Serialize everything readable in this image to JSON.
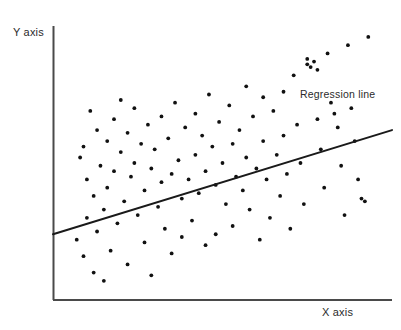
{
  "chart_data": {
    "type": "scatter",
    "title": "",
    "subtitle": "",
    "xlabel": "X axis",
    "ylabel": "Y axis",
    "xlim": [
      0,
      100
    ],
    "ylim": [
      0,
      100
    ],
    "grid": false,
    "legend_position": "none",
    "annotations": [
      {
        "name": "regression-line-label",
        "text": "Regression line",
        "x": 82,
        "y": 80
      }
    ],
    "series": [
      {
        "name": "observations",
        "marker": "circle",
        "marker_color": "#111111",
        "marker_size_px": 3,
        "points": [
          [
            7,
            22
          ],
          [
            8,
            52
          ],
          [
            9,
            56
          ],
          [
            9,
            16
          ],
          [
            10,
            44
          ],
          [
            10,
            30
          ],
          [
            11,
            69
          ],
          [
            12,
            10
          ],
          [
            12,
            38
          ],
          [
            13,
            62
          ],
          [
            13,
            25
          ],
          [
            14,
            49
          ],
          [
            15,
            33
          ],
          [
            15,
            7
          ],
          [
            16,
            58
          ],
          [
            16,
            41
          ],
          [
            17,
            18
          ],
          [
            18,
            66
          ],
          [
            18,
            47
          ],
          [
            19,
            28
          ],
          [
            20,
            73
          ],
          [
            20,
            54
          ],
          [
            21,
            36
          ],
          [
            22,
            61
          ],
          [
            22,
            13
          ],
          [
            23,
            45
          ],
          [
            24,
            70
          ],
          [
            24,
            50
          ],
          [
            25,
            31
          ],
          [
            26,
            57
          ],
          [
            27,
            40
          ],
          [
            27,
            21
          ],
          [
            28,
            64
          ],
          [
            29,
            48
          ],
          [
            29,
            9
          ],
          [
            30,
            55
          ],
          [
            31,
            34
          ],
          [
            32,
            67
          ],
          [
            32,
            43
          ],
          [
            33,
            26
          ],
          [
            34,
            59
          ],
          [
            35,
            46
          ],
          [
            35,
            17
          ],
          [
            36,
            72
          ],
          [
            37,
            51
          ],
          [
            38,
            37
          ],
          [
            38,
            23
          ],
          [
            39,
            63
          ],
          [
            40,
            44
          ],
          [
            41,
            29
          ],
          [
            42,
            68
          ],
          [
            42,
            53
          ],
          [
            43,
            39
          ],
          [
            44,
            60
          ],
          [
            45,
            20
          ],
          [
            45,
            47
          ],
          [
            46,
            75
          ],
          [
            47,
            56
          ],
          [
            48,
            42
          ],
          [
            48,
            24
          ],
          [
            49,
            65
          ],
          [
            50,
            50
          ],
          [
            51,
            35
          ],
          [
            52,
            71
          ],
          [
            53,
            57
          ],
          [
            53,
            27
          ],
          [
            54,
            45
          ],
          [
            55,
            62
          ],
          [
            56,
            40
          ],
          [
            57,
            78
          ],
          [
            57,
            52
          ],
          [
            58,
            33
          ],
          [
            59,
            67
          ],
          [
            60,
            48
          ],
          [
            61,
            22
          ],
          [
            62,
            74
          ],
          [
            62,
            58
          ],
          [
            63,
            44
          ],
          [
            64,
            30
          ],
          [
            65,
            69
          ],
          [
            66,
            53
          ],
          [
            67,
            38
          ],
          [
            68,
            76
          ],
          [
            68,
            60
          ],
          [
            69,
            46
          ],
          [
            70,
            26
          ],
          [
            71,
            82
          ],
          [
            72,
            64
          ],
          [
            73,
            50
          ],
          [
            74,
            35
          ],
          [
            75,
            88
          ],
          [
            75,
            86
          ],
          [
            76,
            85
          ],
          [
            77,
            87
          ],
          [
            78,
            84
          ],
          [
            78,
            66
          ],
          [
            79,
            55
          ],
          [
            80,
            41
          ],
          [
            81,
            90
          ],
          [
            82,
            72
          ],
          [
            83,
            68
          ],
          [
            84,
            63
          ],
          [
            85,
            49
          ],
          [
            86,
            31
          ],
          [
            87,
            93
          ],
          [
            88,
            70
          ],
          [
            89,
            58
          ],
          [
            90,
            44
          ],
          [
            91,
            37
          ],
          [
            92,
            36
          ],
          [
            93,
            96
          ]
        ]
      }
    ],
    "regression_line": {
      "name": "Regression line",
      "color": "#1a1a1a",
      "width_px": 2,
      "start": [
        0,
        24
      ],
      "end": [
        100,
        62
      ]
    }
  },
  "labels": {
    "y_axis": "Y axis",
    "x_axis": "X axis",
    "regression": "Regression line"
  },
  "colors": {
    "background": "#ffffff",
    "axis": "#4a4a4a",
    "point": "#111111",
    "line": "#1a1a1a",
    "text": "#2b2b2b"
  }
}
